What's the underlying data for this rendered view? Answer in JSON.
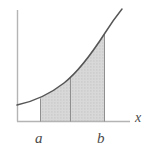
{
  "figure": {
    "title": "",
    "background_color": "#ffffff",
    "axis_color": "#b0b0b0",
    "curve_color": "#555555",
    "shade_fill_color": "#d4d4d4",
    "shade_edge_color": "#8a8a8a",
    "labels": {
      "x_axis": "x",
      "lower_limit": "a",
      "upper_limit": "b"
    }
  },
  "chart_data": {
    "type": "line",
    "title": "",
    "xlabel": "x",
    "ylabel": "",
    "grid": false,
    "legend": null,
    "axis_origin": [
      17,
      121
    ],
    "xlim": [
      17,
      130
    ],
    "ylim": [
      9,
      121
    ],
    "curve": {
      "name": "f(x)",
      "description": "increasing convex curve",
      "points": [
        [
          17,
          105
        ],
        [
          26,
          103
        ],
        [
          36,
          100
        ],
        [
          46,
          95
        ],
        [
          56,
          89
        ],
        [
          66,
          81
        ],
        [
          76,
          71
        ],
        [
          86,
          59
        ],
        [
          96,
          45
        ],
        [
          106,
          31
        ],
        [
          114,
          19
        ],
        [
          122,
          9
        ]
      ]
    },
    "shaded_region": {
      "label": "area under curve from a to b",
      "x_start": 40,
      "x_end": 105,
      "fill": "#d4d4d4",
      "hatch": "dots"
    },
    "vertical_rules": [
      {
        "name": "a",
        "x": 40
      },
      {
        "name": "midpoint",
        "x": 70
      },
      {
        "name": "b",
        "x": 105
      }
    ],
    "tick_labels": [
      {
        "text": "a",
        "x": 40
      },
      {
        "text": "b",
        "x": 102
      }
    ]
  }
}
